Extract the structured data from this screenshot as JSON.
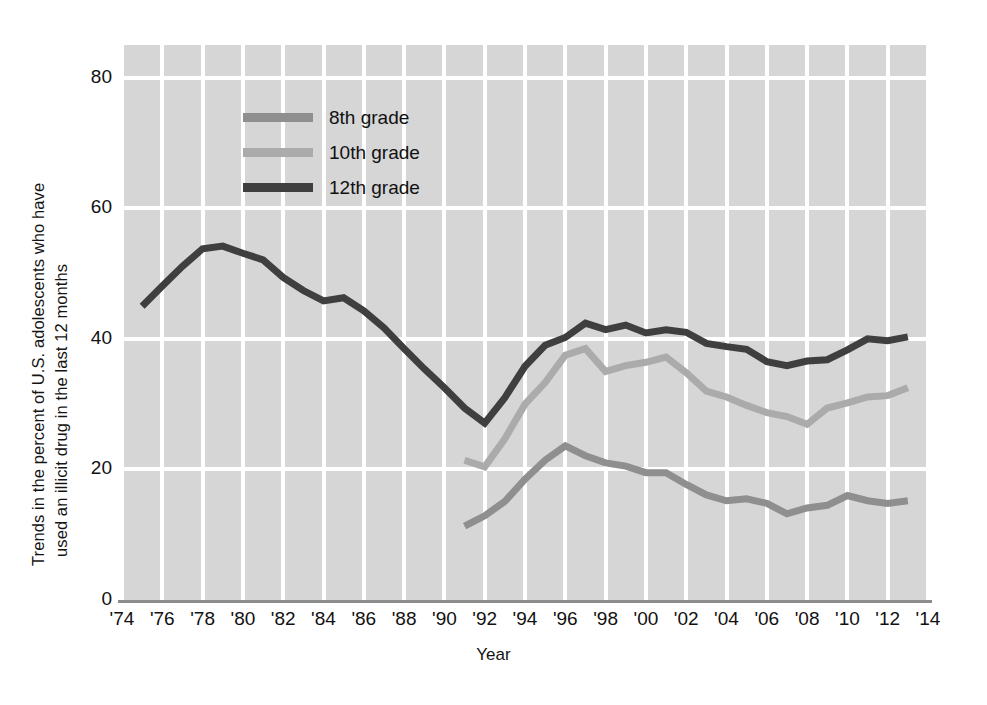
{
  "chart_data": {
    "type": "line",
    "title": "",
    "xlabel": "Year",
    "ylabel_line1": "Trends in the percent of U.S. adolescents  who have",
    "ylabel_line2": "used an illicit drug in the last 12 months",
    "xlim": [
      1974,
      2014
    ],
    "ylim": [
      0,
      85
    ],
    "grid": true,
    "legend_position": "top-left-inside",
    "xticks": [
      "'74",
      "'76",
      "'78",
      "'80",
      "'82",
      "'84",
      "'86",
      "'88",
      "'90",
      "'92",
      "'94",
      "'96",
      "'98",
      "'00",
      "'02",
      "'04",
      "'06",
      "'08",
      "'10",
      "'12",
      "'14"
    ],
    "xtick_values": [
      1974,
      1976,
      1978,
      1980,
      1982,
      1984,
      1986,
      1988,
      1990,
      1992,
      1994,
      1996,
      1998,
      2000,
      2002,
      2004,
      2006,
      2008,
      2010,
      2012,
      2014
    ],
    "yticks": [
      "0",
      "20",
      "40",
      "60",
      "80"
    ],
    "ytick_values": [
      0,
      20,
      40,
      60,
      80
    ],
    "series": [
      {
        "name": "8th grade",
        "color": "#8f8f8f",
        "x": [
          1991,
          1992,
          1993,
          1994,
          1995,
          1996,
          1997,
          1998,
          1999,
          2000,
          2001,
          2002,
          2003,
          2004,
          2005,
          2006,
          2007,
          2008,
          2009,
          2010,
          2011,
          2012,
          2013
        ],
        "values": [
          11.3,
          12.9,
          15.1,
          18.5,
          21.4,
          23.6,
          22.1,
          21.0,
          20.5,
          19.5,
          19.5,
          17.7,
          16.1,
          15.2,
          15.5,
          14.8,
          13.2,
          14.1,
          14.5,
          16.0,
          15.2,
          14.8,
          15.2
        ]
      },
      {
        "name": "10th grade",
        "color": "#ababab",
        "x": [
          1991,
          1992,
          1993,
          1994,
          1995,
          1996,
          1997,
          1998,
          1999,
          2000,
          2001,
          2002,
          2003,
          2004,
          2005,
          2006,
          2007,
          2008,
          2009,
          2010,
          2011,
          2012,
          2013
        ],
        "values": [
          21.4,
          20.4,
          24.7,
          30.0,
          33.3,
          37.5,
          38.5,
          35.0,
          35.9,
          36.4,
          37.2,
          34.8,
          32.0,
          31.1,
          29.8,
          28.7,
          28.1,
          26.9,
          29.4,
          30.2,
          31.1,
          31.3,
          32.5
        ]
      },
      {
        "name": "12th grade",
        "color": "#3f3f3f",
        "x": [
          1975,
          1976,
          1977,
          1978,
          1979,
          1980,
          1981,
          1982,
          1983,
          1984,
          1985,
          1986,
          1987,
          1988,
          1989,
          1990,
          1991,
          1992,
          1993,
          1994,
          1995,
          1996,
          1997,
          1998,
          1999,
          2000,
          2001,
          2002,
          2003,
          2004,
          2005,
          2006,
          2007,
          2008,
          2009,
          2010,
          2011,
          2012,
          2013
        ],
        "values": [
          45.0,
          48.1,
          51.1,
          53.8,
          54.2,
          53.1,
          52.1,
          49.4,
          47.4,
          45.8,
          46.3,
          44.3,
          41.7,
          38.5,
          35.4,
          32.5,
          29.4,
          27.1,
          31.0,
          35.8,
          39.0,
          40.2,
          42.4,
          41.4,
          42.1,
          40.9,
          41.4,
          41.0,
          39.3,
          38.8,
          38.4,
          36.5,
          35.9,
          36.6,
          36.8,
          38.3,
          40.0,
          39.7,
          40.3
        ]
      }
    ]
  },
  "legend": {
    "items": [
      {
        "label": "8th grade",
        "color": "#8f8f8f"
      },
      {
        "label": "10th grade",
        "color": "#ababab"
      },
      {
        "label": "12th grade",
        "color": "#3f3f3f"
      }
    ]
  },
  "axes": {
    "x_title": "Year",
    "y_title_line1": "Trends in the percent of U.S. adolescents  who have",
    "y_title_line2": "used an illicit drug in the last 12 months"
  },
  "colors": {
    "plot_background": "#d6d6d6",
    "gridline": "#ffffff",
    "axis_line": "#8c8c8c",
    "text": "#111111"
  }
}
